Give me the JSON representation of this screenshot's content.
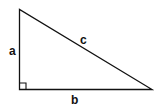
{
  "diagram": {
    "type": "right-triangle",
    "labels": {
      "leg_vertical": "a",
      "leg_horizontal": "b",
      "hypotenuse": "c"
    },
    "right_angle_marker": true,
    "stroke_color": "#111111",
    "background": "#ffffff"
  }
}
